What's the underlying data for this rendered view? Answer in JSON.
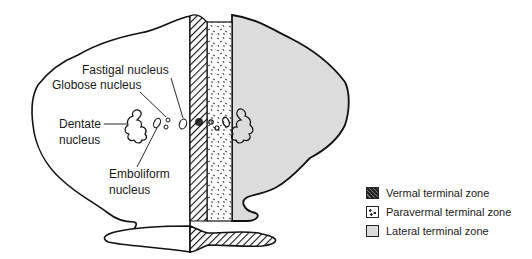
{
  "diagram": {
    "labels": {
      "fastigal": "Fastigal nucleus",
      "globose": "Globose nucleus",
      "dentate_line1": "Dentate",
      "dentate_line2": "nucleus",
      "emboliform_line1": "Emboliform",
      "emboliform_line2": "nucleus"
    },
    "legend": [
      {
        "label": "Vermal terminal zone",
        "pattern": "diagonal-hatch",
        "color": "#2a2a2a"
      },
      {
        "label": "Paravermal terminal zone",
        "pattern": "speckled",
        "color": "#ffffff"
      },
      {
        "label": "Lateral terminal zone",
        "pattern": "solid",
        "color": "#dcdcdc"
      }
    ],
    "colors": {
      "outline": "#111111",
      "lateral_fill": "#dcdcdc",
      "background": "#ffffff"
    }
  }
}
